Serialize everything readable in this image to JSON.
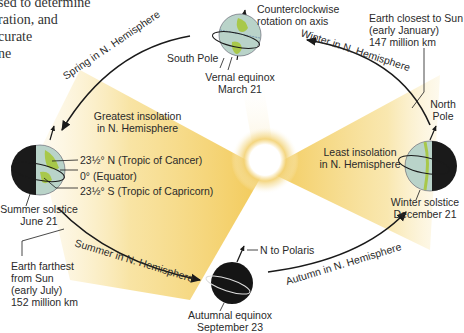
{
  "intro_text": {
    "lines": [
      "sed to determine",
      "ration, and",
      "curate",
      "ne",
      "."
    ]
  },
  "seasons_arcs": {
    "spring": "Spring in N. Hemisphere",
    "winter": "Winter in N. Hemisphere",
    "summer": "Summer in N. Hemisphere",
    "autumn": "Autumn in N. Hemisphere"
  },
  "vernal": {
    "south_pole": "South Pole",
    "rotation_line1": "Counterclockwise",
    "rotation_line2": "rotation on axis",
    "name": "Vernal equinox",
    "date": "March 21"
  },
  "winter_solstice": {
    "north_pole_line1": "North",
    "north_pole_line2": "Pole",
    "name": "Winter solstice",
    "date": "December 21",
    "closest_line1": "Earth closest to Sun",
    "closest_line2": "(early January)",
    "closest_line3": "147 million km"
  },
  "summer_solstice": {
    "name": "Summer solstice",
    "date": "June 21",
    "tropic_cancer": "23½° N (Tropic of Cancer)",
    "equator": "0° (Equator)",
    "tropic_capricorn": "23½° S (Tropic of Capricorn)",
    "farthest_line1": "Earth farthest",
    "farthest_line2": "from Sun",
    "farthest_line3": "(early July)",
    "farthest_line4": "152 million km"
  },
  "autumnal": {
    "polaris": "N to Polaris",
    "name": "Autumnal equinox",
    "date": "September 23"
  },
  "insolation": {
    "greatest_line1": "Greatest insolation",
    "greatest_line2": "in N. Hemisphere",
    "least_line1": "Least insolation",
    "least_line2": "in N. Hemisphere"
  },
  "colors": {
    "sun_glow": "#f2c94c",
    "beam": "#f0c240",
    "ocean": "#b9d3c9",
    "land": "#a8c84a",
    "night": "#1a1a1a",
    "orbit": "#1a1a1a"
  }
}
